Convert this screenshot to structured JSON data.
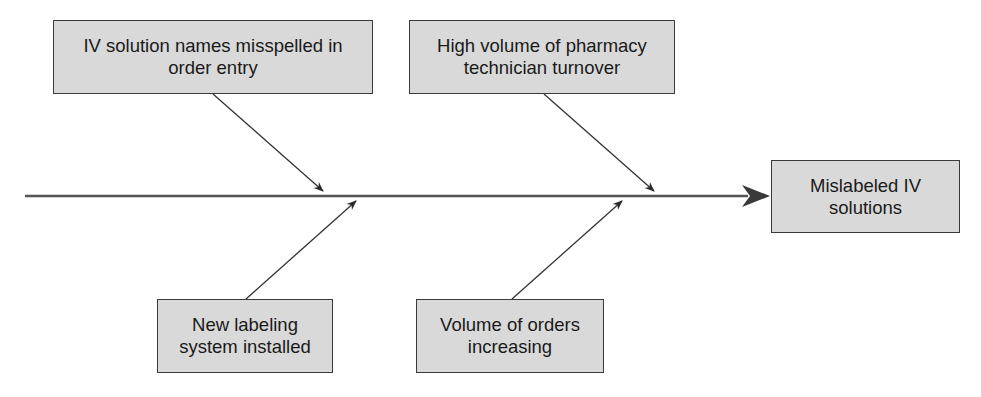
{
  "diagram": {
    "type": "fishbone",
    "effect": {
      "label_line1": "Mislabeled IV",
      "label_line2": "solutions"
    },
    "causes": [
      {
        "position": "top-left",
        "label_line1": "IV solution names misspelled in",
        "label_line2": "order entry"
      },
      {
        "position": "top-right",
        "label_line1": "High volume of pharmacy",
        "label_line2": "technician turnover"
      },
      {
        "position": "bottom-left",
        "label_line1": "New labeling",
        "label_line2": "system installed"
      },
      {
        "position": "bottom-right",
        "label_line1": "Volume of orders",
        "label_line2": "increasing"
      }
    ],
    "colors": {
      "box_fill": "#d9d9d9",
      "box_border": "#3a3a3a",
      "spine": "#555555",
      "arrow": "#2a2a2a"
    }
  }
}
